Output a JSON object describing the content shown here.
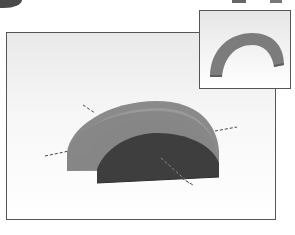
{
  "scene": {
    "main_view": {
      "object": "half-cylinder arch solid",
      "colors": {
        "outer_face": "#8a8a8a",
        "top_face": "#959595",
        "front_face": "#3e3e3e",
        "axis_line": "#444444"
      },
      "axes": [
        "x-axis-dashed",
        "y-axis-dashed"
      ]
    },
    "inset_view": {
      "object": "arch ring preview",
      "colors": {
        "ring": "#7f7f7f",
        "ring_dark": "#666666"
      }
    }
  }
}
